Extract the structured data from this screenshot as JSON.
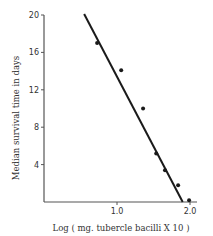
{
  "chart_data": {
    "type": "scatter",
    "title": "",
    "xlabel": "Log ( mg. tubercle bacilli X 10 )",
    "ylabel": "Median survival time in days",
    "xlim": [
      0,
      2.0
    ],
    "ylim": [
      0,
      20
    ],
    "x_ticks": [
      {
        "value": 1.0,
        "label": "1.0"
      },
      {
        "value": 2.0,
        "label": "2.0"
      }
    ],
    "y_ticks": [
      {
        "value": 4,
        "label": "4"
      },
      {
        "value": 8,
        "label": "8"
      },
      {
        "value": 12,
        "label": "12"
      },
      {
        "value": 16,
        "label": "16"
      },
      {
        "value": 20,
        "label": "20"
      }
    ],
    "grid": false,
    "legend": null,
    "series": [
      {
        "name": "observations",
        "kind": "scatter",
        "x": [
          0.7,
          1.03,
          1.33,
          1.51,
          1.63,
          1.81,
          1.96
        ],
        "y": [
          17.0,
          14.1,
          10.0,
          5.2,
          3.4,
          1.8,
          0.2
        ]
      },
      {
        "name": "fitted line",
        "kind": "line",
        "x": [
          0.55,
          1.9
        ],
        "y": [
          20.1,
          0.0
        ]
      }
    ]
  },
  "colors": {
    "ink": "#1a1a1a",
    "axis": "#555555",
    "background": "#ffffff"
  }
}
